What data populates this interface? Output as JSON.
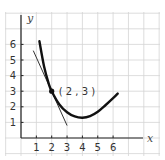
{
  "chart_data": {
    "type": "line",
    "title": "",
    "xlabel": "x",
    "ylabel": "y",
    "x_ticks": [
      "1",
      "2",
      "3",
      "4",
      "5",
      "6"
    ],
    "y_ticks": [
      "1",
      "2",
      "3",
      "4",
      "5",
      "6"
    ],
    "xlim": [
      0,
      7
    ],
    "ylim": [
      0,
      6.5
    ],
    "grid": true,
    "legend": "none",
    "series": [
      {
        "name": "curve",
        "style": "thick",
        "x": [
          1.2,
          1.5,
          1.8,
          2.0,
          2.5,
          3.0,
          3.5,
          4.0,
          4.5,
          5.0,
          5.5,
          6.0,
          6.3
        ],
        "y": [
          6.2,
          4.6,
          3.5,
          3.0,
          2.15,
          1.65,
          1.38,
          1.3,
          1.4,
          1.68,
          2.1,
          2.55,
          2.85
        ]
      },
      {
        "name": "tangent line at (2,3)",
        "style": "thin",
        "x": [
          0.8,
          3.0
        ],
        "y": [
          5.6,
          0.8
        ]
      }
    ],
    "annotations": [
      {
        "type": "point",
        "x": 2,
        "y": 3,
        "label": "(2,3)"
      }
    ]
  },
  "labels": {
    "x_axis": "x",
    "y_axis": "y",
    "point": "( 2 , 3 )",
    "x_ticks": [
      "1",
      "2",
      "3",
      "4",
      "5",
      "6"
    ],
    "y_ticks": [
      "1",
      "2",
      "3",
      "4",
      "5",
      "6"
    ]
  }
}
